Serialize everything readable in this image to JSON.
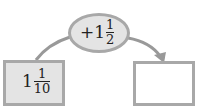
{
  "diagram": {
    "start_value": {
      "whole": "1",
      "numerator": "1",
      "denominator": "10"
    },
    "operation": {
      "sign": "+",
      "whole": "1",
      "numerator": "1",
      "denominator": "2"
    },
    "result_value": ""
  },
  "colors": {
    "border": "#a8a8a8",
    "fill": "#e4e4e4",
    "line": "#999999"
  }
}
